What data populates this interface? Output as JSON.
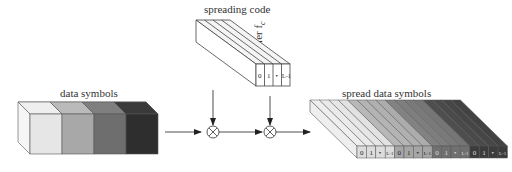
{
  "labels": {
    "spreading_code": "spreading code",
    "data_symbols": "data symbols",
    "carrier": "carrier f",
    "carrier_sub": "c",
    "spread_data_symbols": "spread data symbols"
  },
  "spreading_code": {
    "cells": [
      "0",
      "1",
      "•",
      "L-1"
    ]
  },
  "data_symbols": {
    "colors": [
      "#e6e6e6",
      "#a8a8a8",
      "#6e6e6e",
      "#2e2e2e"
    ]
  },
  "spread_data_symbols": {
    "cells": [
      "0",
      "1",
      "•",
      "L-1",
      "0",
      "1",
      "•",
      "L-1",
      "0",
      "1",
      "•",
      "L-1",
      "0",
      "1",
      "•",
      "L-1"
    ],
    "group_colors": [
      "#dcdcdc",
      "#a6a6a6",
      "#707070",
      "#3c3c3c"
    ]
  },
  "operators": {
    "mixer1": "⊗",
    "mixer2": "⊗"
  }
}
